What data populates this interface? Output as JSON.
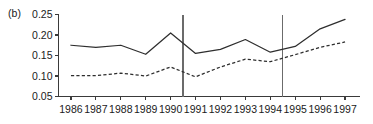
{
  "figure": {
    "panel_label": "(b)",
    "background_color": "#ffffff",
    "line_color": "#2e2e2e",
    "axis_color": "#3a3a3a",
    "marker_line_color": "#6b6b6b"
  },
  "chart_data": {
    "type": "line",
    "title": "",
    "subtitle": "",
    "xlabel": "",
    "ylabel": "",
    "categories": [
      "1986",
      "1987",
      "1988",
      "1989",
      "1990",
      "1991",
      "1992",
      "1993",
      "1994",
      "1995",
      "1996",
      "1997"
    ],
    "x": [
      1986,
      1987,
      1988,
      1989,
      1990,
      1991,
      1992,
      1993,
      1994,
      1995,
      1996,
      1997
    ],
    "xlim": [
      1985.5,
      1997.6
    ],
    "ylim": [
      0.05,
      0.25
    ],
    "yticks": [
      0.05,
      0.1,
      0.15,
      0.2,
      0.25
    ],
    "ytick_labels": [
      "0.05",
      "0.10",
      "0.15",
      "0.20",
      "0.25"
    ],
    "xtick_labels": [
      "1986",
      "1987",
      "1988",
      "1989",
      "1990",
      "1991",
      "1992",
      "1993",
      "1994",
      "1995",
      "1996",
      "1997"
    ],
    "grid": false,
    "legend": null,
    "series": [
      {
        "name": "solid",
        "style": "solid",
        "values": [
          0.175,
          0.17,
          0.175,
          0.153,
          0.205,
          0.155,
          0.165,
          0.189,
          0.158,
          0.172,
          0.215,
          0.238
        ]
      },
      {
        "name": "dashed",
        "style": "dashed",
        "values": [
          0.101,
          0.101,
          0.107,
          0.1,
          0.122,
          0.098,
          0.122,
          0.141,
          0.135,
          0.152,
          0.17,
          0.183
        ]
      }
    ],
    "vertical_reference_lines": [
      1990.5,
      1994.5
    ],
    "annotations": [
      "(b)"
    ]
  }
}
